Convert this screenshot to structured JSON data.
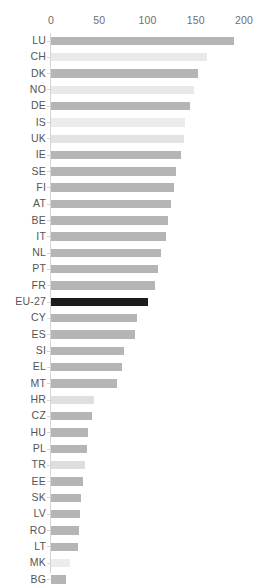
{
  "chart_data": {
    "type": "bar",
    "orientation": "horizontal",
    "title": "",
    "xlabel": "",
    "ylabel": "",
    "xlim": [
      0,
      200
    ],
    "xticks": [
      0,
      50,
      100,
      150,
      200
    ],
    "grid": false,
    "legend": null,
    "reference_category": "EU-27",
    "reference_value": 100,
    "categories": [
      "LU",
      "CH",
      "DK",
      "NO",
      "DE",
      "IS",
      "UK",
      "IE",
      "SE",
      "FI",
      "AT",
      "BE",
      "IT",
      "NL",
      "PT",
      "FR",
      "EU-27",
      "CY",
      "ES",
      "SI",
      "EL",
      "MT",
      "HR",
      "CZ",
      "HU",
      "PL",
      "TR",
      "EE",
      "SK",
      "LV",
      "RO",
      "LT",
      "MK",
      "BG"
    ],
    "values": [
      190,
      162,
      152,
      148,
      144,
      139,
      138,
      135,
      130,
      127,
      124,
      121,
      119,
      114,
      111,
      108,
      100,
      89,
      87,
      76,
      74,
      68,
      45,
      43,
      38,
      37,
      35,
      33,
      31,
      30,
      29,
      28,
      20,
      16
    ],
    "bar_colors": [
      "#b5b5b5",
      "#e9e9e9",
      "#b5b5b5",
      "#e9e9e9",
      "#b5b5b5",
      "#ececec",
      "#e3e3e3",
      "#b5b5b5",
      "#b5b5b5",
      "#b5b5b5",
      "#b5b5b5",
      "#b5b5b5",
      "#b5b5b5",
      "#b5b5b5",
      "#b5b5b5",
      "#b5b5b5",
      "#1c1c1c",
      "#b5b5b5",
      "#b5b5b5",
      "#b5b5b5",
      "#b5b5b5",
      "#b5b5b5",
      "#e0e0e0",
      "#b5b5b5",
      "#b5b5b5",
      "#b5b5b5",
      "#dedede",
      "#b5b5b5",
      "#b5b5b5",
      "#b5b5b5",
      "#b5b5b5",
      "#b5b5b5",
      "#ececec",
      "#b5b5b5"
    ],
    "series": [
      {
        "name": "value",
        "points": [
          {
            "category": "LU",
            "value": 190
          },
          {
            "category": "CH",
            "value": 162
          },
          {
            "category": "DK",
            "value": 152
          },
          {
            "category": "NO",
            "value": 148
          },
          {
            "category": "DE",
            "value": 144
          },
          {
            "category": "IS",
            "value": 139
          },
          {
            "category": "UK",
            "value": 138
          },
          {
            "category": "IE",
            "value": 135
          },
          {
            "category": "SE",
            "value": 130
          },
          {
            "category": "FI",
            "value": 127
          },
          {
            "category": "AT",
            "value": 124
          },
          {
            "category": "BE",
            "value": 121
          },
          {
            "category": "IT",
            "value": 119
          },
          {
            "category": "NL",
            "value": 114
          },
          {
            "category": "PT",
            "value": 111
          },
          {
            "category": "FR",
            "value": 108
          },
          {
            "category": "EU-27",
            "value": 100
          },
          {
            "category": "CY",
            "value": 89
          },
          {
            "category": "ES",
            "value": 87
          },
          {
            "category": "SI",
            "value": 76
          },
          {
            "category": "EL",
            "value": 74
          },
          {
            "category": "MT",
            "value": 68
          },
          {
            "category": "HR",
            "value": 45
          },
          {
            "category": "CZ",
            "value": 43
          },
          {
            "category": "HU",
            "value": 38
          },
          {
            "category": "PL",
            "value": 37
          },
          {
            "category": "TR",
            "value": 35
          },
          {
            "category": "EE",
            "value": 33
          },
          {
            "category": "SK",
            "value": 31
          },
          {
            "category": "LV",
            "value": 30
          },
          {
            "category": "RO",
            "value": 29
          },
          {
            "category": "LT",
            "value": 28
          },
          {
            "category": "MK",
            "value": 20
          },
          {
            "category": "BG",
            "value": 16
          }
        ]
      }
    ]
  },
  "colors": {
    "bar_default": "#b5b5b5",
    "bar_light": "#e9e9e9",
    "bar_highlight": "#1c1c1c",
    "axis_line": "#d5d5d5",
    "tick_text": "#6e6e6e",
    "label_text": "#555555",
    "background": "#ffffff"
  }
}
